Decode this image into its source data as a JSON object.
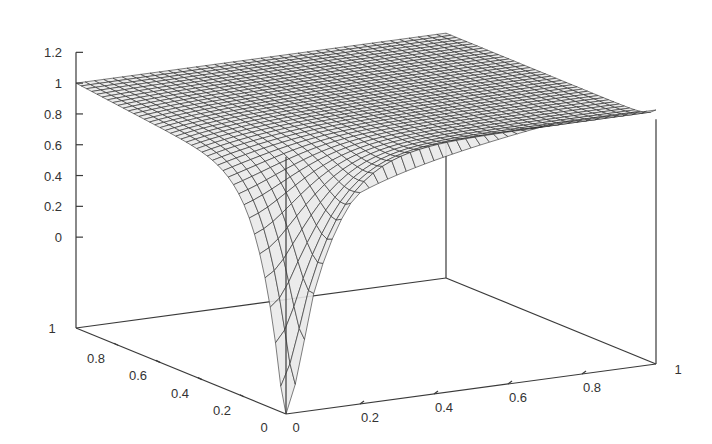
{
  "chart_data": {
    "type": "surface3d",
    "title": "",
    "xlabel": "",
    "ylabel": "",
    "zlabel": "",
    "x_range": [
      0,
      1
    ],
    "y_range": [
      0,
      1
    ],
    "z_range": [
      -0.59,
      1.2
    ],
    "x_ticks": [
      "0",
      "0.2",
      "0.4",
      "0.6",
      "0.8",
      "1"
    ],
    "y_ticks": [
      "0",
      "0.2",
      "0.4",
      "0.6",
      "0.8",
      "1"
    ],
    "z_ticks": [
      "0",
      "0.2",
      "0.4",
      "0.6",
      "0.8",
      "1",
      "1.2"
    ],
    "x_tick_values": [
      0,
      0.2,
      0.4,
      0.6,
      0.8,
      1
    ],
    "y_tick_values": [
      0,
      0.2,
      0.4,
      0.6,
      0.8,
      1
    ],
    "z_tick_values": [
      0,
      0.2,
      0.4,
      0.6,
      0.8,
      1,
      1.2
    ],
    "grid_resolution": 40,
    "surface_description": "Wireframe surface approximately equal to 1 over most of the unit square, dipping slightly along the x=0 edge and dropping sharply toward the bottom of the box near the origin (0,0).",
    "corner_values": {
      "x0_y0": -0.59,
      "x1_y0": 1.0,
      "x0_y1": 1.0,
      "x1_y1": 1.0
    },
    "colors": {
      "mesh": "#2a2a2a",
      "axis": "#3a3a3a",
      "background": "#ffffff"
    }
  }
}
